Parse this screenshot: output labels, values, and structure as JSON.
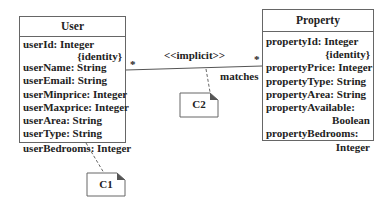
{
  "classes": {
    "user": {
      "name": "User",
      "attributes": [
        {
          "text": "userId: Integer",
          "tag": "{identity}"
        },
        {
          "text": "userName: String"
        },
        {
          "text": "userEmail: String"
        },
        {
          "text": "userMinprice: Integer"
        },
        {
          "text": "userMaxprice: Integer"
        },
        {
          "text": "userArea: String"
        },
        {
          "text": "userType: String"
        },
        {
          "text": "userBedrooms: Integer"
        }
      ]
    },
    "property": {
      "name": "Property",
      "attributes": [
        {
          "text": "propertyId: Integer",
          "tag": "{identity}"
        },
        {
          "text": "propertyPrice: Integer"
        },
        {
          "text": "propertyType: String"
        },
        {
          "text": "propertyArea: String"
        },
        {
          "text": "propertyAvailable:",
          "tag": "Boolean"
        },
        {
          "text": "propertyBedrooms:",
          "tag": "Integer"
        }
      ]
    }
  },
  "association": {
    "stereotype": "<<implicit>>",
    "name": "matches",
    "multiplicity_user": "*",
    "multiplicity_property": "*"
  },
  "notes": {
    "c1": "C1",
    "c2": "C2"
  },
  "colors": {
    "line": "#555555",
    "note_fold": "#555555"
  }
}
